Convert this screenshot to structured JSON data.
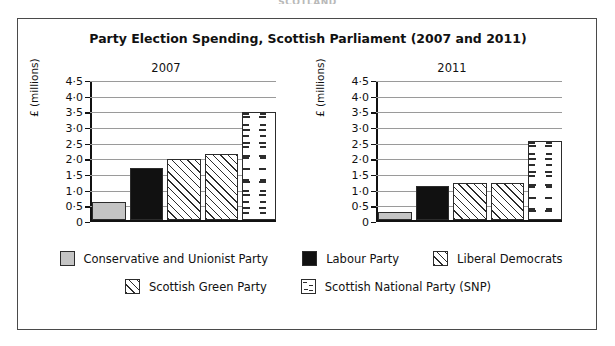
{
  "top_stub": "SCOTLAND",
  "chart_data": {
    "type": "bar",
    "title": "Party Election Spending, Scottish Parliament (2007 and 2011)",
    "xlabel": "",
    "ylabel": "£ (millions)",
    "ylim": [
      0,
      4.5
    ],
    "ytick_labels": [
      "4·5",
      "4·0",
      "3·5",
      "3·0",
      "2·5",
      "2·0",
      "1·5",
      "1·0",
      "0·5",
      "0"
    ],
    "ytick_values": [
      4.5,
      4.0,
      3.5,
      3.0,
      2.5,
      2.0,
      1.5,
      1.0,
      0.5,
      0
    ],
    "grid": true,
    "legend_position": "bottom",
    "categories": [
      "Conservative and Unionist Party",
      "Labour Party",
      "Liberal Democrats",
      "Scottish Green Party",
      "Scottish National Party (SNP)"
    ],
    "panels": [
      {
        "label": "2007",
        "values": [
          0.6,
          1.7,
          2.0,
          2.15,
          3.5
        ]
      },
      {
        "label": "2011",
        "values": [
          0.28,
          1.12,
          1.22,
          1.2,
          2.58
        ]
      }
    ],
    "series": [
      {
        "name": "2007",
        "values": [
          0.6,
          1.7,
          2.0,
          2.15,
          3.5
        ]
      },
      {
        "name": "2011",
        "values": [
          0.28,
          1.12,
          1.22,
          1.2,
          2.58
        ]
      }
    ],
    "legend": [
      {
        "label": "Conservative and Unionist Party",
        "pattern": "solid-grey",
        "color": "#c4c4c4"
      },
      {
        "label": "Labour Party",
        "pattern": "solid-black",
        "color": "#111111"
      },
      {
        "label": "Liberal Democrats",
        "pattern": "diagonal-hatch",
        "color": "#2c2c2c"
      },
      {
        "label": "Scottish Green Party",
        "pattern": "diagonal-hatch",
        "color": "#2c2c2c"
      },
      {
        "label": "Scottish National Party (SNP)",
        "pattern": "dashed-fill",
        "color": "#2c2c2c"
      }
    ]
  }
}
